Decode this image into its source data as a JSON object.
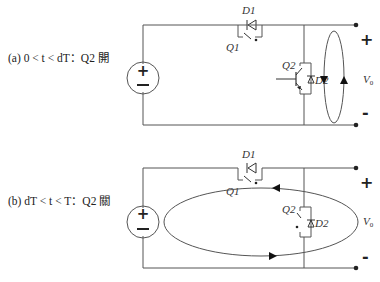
{
  "figure": {
    "panels": [
      {
        "id": "a",
        "caption": "(a) 0 < t < dT：Q2 開",
        "state": "Q2 on",
        "labels": {
          "d1": "D1",
          "q1": "Q1",
          "q2": "Q2",
          "d2": "D2",
          "vo": "V",
          "vo_sub": "0",
          "plus": "+",
          "minus": "-"
        },
        "current_loop": "local loop around output terminals (down on left, up on right)"
      },
      {
        "id": "b",
        "caption": "(b) dT < t < T：Q2 關",
        "state": "Q2 off",
        "labels": {
          "d1": "D1",
          "q1": "Q1",
          "q2": "Q2",
          "d2": "D2",
          "vo": "V",
          "vo_sub": "0",
          "plus": "+",
          "minus": "-"
        },
        "current_loop": "large loop through source and Q2/D2 branch (top leftward, bottom rightward)"
      }
    ],
    "source_symbol": {
      "plus": "+",
      "minus": "−"
    }
  }
}
